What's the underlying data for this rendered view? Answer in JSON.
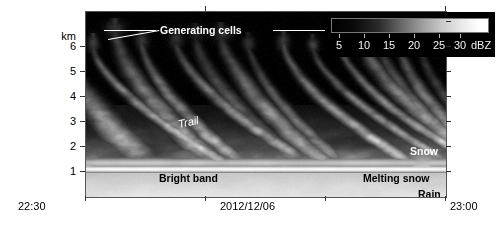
{
  "figure": {
    "type": "radar-time-height-reflectivity",
    "date": "2012/12/06"
  },
  "yaxis": {
    "unit": "km",
    "ticks": [
      6,
      5,
      4,
      3,
      2,
      1
    ],
    "tick_labels": [
      "6",
      "5",
      "4",
      "3",
      "2",
      "1"
    ],
    "range_km": [
      0,
      7.2
    ]
  },
  "xaxis": {
    "start_label": "22:30",
    "center_label": "2012/12/06",
    "end_label": "23:00",
    "ticks": [
      "22:30",
      "22:40",
      "22:50",
      "23:00"
    ]
  },
  "colorbar": {
    "unit": "dBZ",
    "tick_values": [
      5,
      10,
      15,
      20,
      25,
      30
    ],
    "tick_labels": [
      "5",
      "10",
      "15",
      "20",
      "25",
      "30"
    ],
    "min_dbz": 0,
    "max_dbz": 35,
    "low_color": "#000000",
    "high_color": "#ffffff"
  },
  "annotations": {
    "generating_cells": "Generating cells",
    "trail": "Trail",
    "bright_band": "Bright band",
    "snow": "Snow",
    "melting_snow": "Melting snow",
    "rain": "Rain"
  },
  "chart_data": {
    "type": "heatmap",
    "title": "",
    "xlabel": "2012/12/06",
    "ylabel": "km",
    "colorbar_label": "dBZ",
    "xlim": [
      "22:30",
      "23:00"
    ],
    "ylim": [
      0,
      7.2
    ],
    "zlim": [
      0,
      35
    ],
    "colormap": "grayscale",
    "grid": false,
    "features": [
      {
        "name": "Generating cells",
        "height_km": [
          5.5,
          7.0
        ],
        "dbz": [
          2,
          8
        ]
      },
      {
        "name": "Trail",
        "height_km": [
          2.0,
          5.0
        ],
        "dbz": [
          5,
          15
        ]
      },
      {
        "name": "Snow",
        "height_km": [
          1.3,
          3.0
        ],
        "dbz": [
          10,
          22
        ]
      },
      {
        "name": "Bright band",
        "height_km": [
          0.9,
          1.2
        ],
        "dbz": [
          28,
          35
        ]
      },
      {
        "name": "Melting snow",
        "height_km": [
          1.0,
          1.3
        ],
        "dbz": [
          22,
          30
        ]
      },
      {
        "name": "Rain",
        "height_km": [
          0.0,
          0.9
        ],
        "dbz": [
          24,
          32
        ]
      }
    ]
  }
}
